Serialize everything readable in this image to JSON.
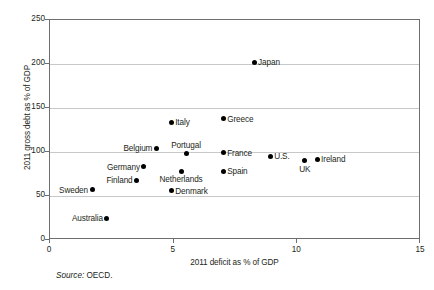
{
  "chart_data": {
    "type": "scatter",
    "title": "",
    "xlabel": "2011 deficit as % of GDP",
    "ylabel": "2011 gross debt as % of GDP",
    "source": "Source: OECD.",
    "source_prefix": "Source:",
    "source_value": " OECD.",
    "xlim": [
      0,
      15
    ],
    "ylim": [
      0,
      250
    ],
    "xticks": [
      "0",
      "5",
      "10",
      "15"
    ],
    "xtick_values": [
      0,
      5,
      10,
      15
    ],
    "yticks": [
      "0",
      "50",
      "100",
      "150",
      "200",
      "250"
    ],
    "ytick_values": [
      0,
      50,
      100,
      150,
      200,
      250
    ],
    "grid": "horizontal",
    "legend": "none",
    "points": [
      {
        "label": "Japan",
        "x": 8.25,
        "y": 202,
        "anchor": "right"
      },
      {
        "label": "Greece",
        "x": 7.0,
        "y": 138,
        "anchor": "right"
      },
      {
        "label": "Italy",
        "x": 4.9,
        "y": 134,
        "anchor": "right"
      },
      {
        "label": "Belgium",
        "x": 4.3,
        "y": 104,
        "anchor": "left"
      },
      {
        "label": "France",
        "x": 7.0,
        "y": 99,
        "anchor": "right"
      },
      {
        "label": "Portugal",
        "x": 5.5,
        "y": 98,
        "anchor": "above"
      },
      {
        "label": "U.S.",
        "x": 8.9,
        "y": 95,
        "anchor": "right"
      },
      {
        "label": "Ireland",
        "x": 10.8,
        "y": 92,
        "anchor": "right"
      },
      {
        "label": "UK",
        "x": 10.3,
        "y": 90,
        "anchor": "below"
      },
      {
        "label": "Germany",
        "x": 3.8,
        "y": 83,
        "anchor": "left"
      },
      {
        "label": "Netherlands",
        "x": 5.3,
        "y": 78,
        "anchor": "below"
      },
      {
        "label": "Spain",
        "x": 7.0,
        "y": 78,
        "anchor": "right"
      },
      {
        "label": "Finland",
        "x": 3.5,
        "y": 68,
        "anchor": "left"
      },
      {
        "label": "Sweden",
        "x": 1.7,
        "y": 57,
        "anchor": "left"
      },
      {
        "label": "Denmark",
        "x": 4.9,
        "y": 56,
        "anchor": "right"
      },
      {
        "label": "Australia",
        "x": 2.3,
        "y": 25,
        "anchor": "left"
      }
    ],
    "colors": {
      "marker": "#000000",
      "frame": "#6d6e70",
      "grid": "#c7c8ca",
      "text": "#231f20",
      "background": "#ffffff"
    }
  }
}
